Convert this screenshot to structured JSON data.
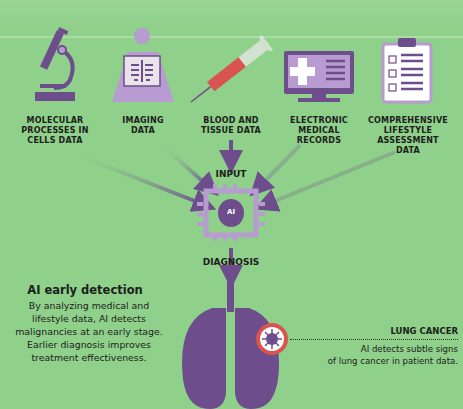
{
  "sources": [
    {
      "id": "molecular",
      "label_lines": [
        "MOLECULAR",
        "PROCESSES IN",
        "CELLS DATA"
      ],
      "icon": "microscope-icon"
    },
    {
      "id": "imaging",
      "label_lines": [
        "IMAGING",
        "DATA"
      ],
      "icon": "xray-icon"
    },
    {
      "id": "blood",
      "label_lines": [
        "BLOOD AND",
        "TISSUE DATA"
      ],
      "icon": "syringe-icon"
    },
    {
      "id": "emr",
      "label_lines": [
        "ELECTRONIC",
        "MEDICAL",
        "RECORDS"
      ],
      "icon": "monitor-medical-icon"
    },
    {
      "id": "lifestyle",
      "label_lines": [
        "COMPREHENSIVE",
        "LIFESTYLE",
        "ASSESSMENT",
        "DATA"
      ],
      "icon": "clipboard-checklist-icon"
    }
  ],
  "flow": {
    "input_label": "INPUT",
    "chip_label": "AI",
    "output_label": "DIAGNOSIS"
  },
  "summary": {
    "heading": "AI early detection",
    "lines": [
      "By analyzing medical and",
      "lifestyle data, AI detects",
      "malignancies at an early stage.",
      "Earlier diagnosis improves",
      "treatment effectiveness."
    ]
  },
  "callout": {
    "title": "LUNG CANCER",
    "lines": [
      "AI detects subtle signs",
      "of lung cancer in patient data."
    ]
  },
  "colors": {
    "background": "#8fd08a",
    "icon_primary": "#6e4d8c",
    "icon_light": "#b89bd0",
    "accent": "#d9534f",
    "text": "#1d1d1d"
  }
}
